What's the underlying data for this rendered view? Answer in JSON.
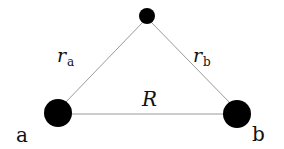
{
  "diagram": {
    "nodes": [
      {
        "id": "top",
        "cx": 147,
        "cy": 16,
        "r": 8
      },
      {
        "id": "a",
        "cx": 58,
        "cy": 113,
        "r": 14,
        "label": "a"
      },
      {
        "id": "b",
        "cx": 237,
        "cy": 114,
        "r": 14,
        "label": "b"
      }
    ],
    "edges": [
      {
        "from": "a",
        "to": "top",
        "label_main": "r",
        "label_sub": "a"
      },
      {
        "from": "top",
        "to": "b",
        "label_main": "r",
        "label_sub": "b"
      },
      {
        "from": "a",
        "to": "b",
        "label_main": "R"
      }
    ],
    "colors": {
      "node": "#000000",
      "edge": "#9a9a9a"
    }
  }
}
